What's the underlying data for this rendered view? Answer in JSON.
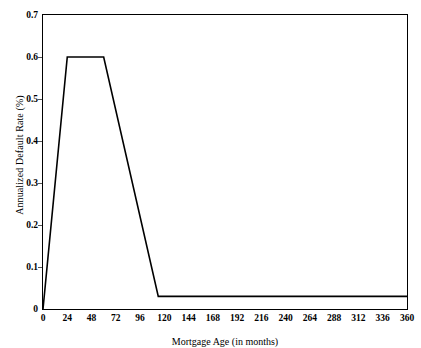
{
  "chart_data": {
    "type": "line",
    "title": "",
    "xlabel": "Mortgage Age (in months)",
    "ylabel": "Annualized Default Rate (%)",
    "xlim": [
      0,
      360
    ],
    "ylim": [
      0,
      0.7
    ],
    "grid": false,
    "legend": null,
    "line_color": "#000000",
    "xticks": [
      0,
      24,
      48,
      72,
      96,
      120,
      144,
      168,
      192,
      216,
      240,
      264,
      288,
      312,
      336,
      360
    ],
    "xtick_labels": [
      "0",
      "24",
      "48",
      "72",
      "96",
      "120",
      "144",
      "168",
      "192",
      "216",
      "240",
      "264",
      "288",
      "312",
      "336",
      "360"
    ],
    "yticks": [
      0,
      0.1,
      0.2,
      0.3,
      0.4,
      0.5,
      0.6,
      0.7
    ],
    "ytick_labels": [
      "0",
      "0.1",
      "0.2",
      "0.3",
      "0.4",
      "0.5",
      "0.6",
      "0.7"
    ],
    "series": [
      {
        "name": "Annualized Default Rate",
        "x": [
          0,
          24,
          60,
          114,
          360
        ],
        "values": [
          0,
          0.6,
          0.6,
          0.03,
          0.03
        ]
      }
    ]
  }
}
